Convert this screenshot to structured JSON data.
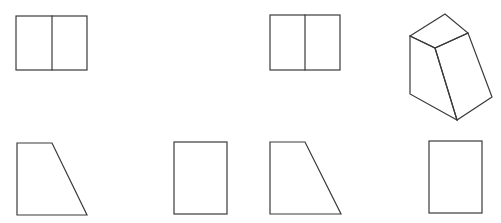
{
  "diagram": {
    "type": "orthographic-projection-views",
    "background": "#ffffff",
    "line_color": "#3a3a3a",
    "figures": [
      {
        "id": "view-a-top",
        "kind": "rectangle-split",
        "x": 16,
        "y": 16,
        "width": 71,
        "height": 54,
        "divider_x": 52
      },
      {
        "id": "view-b-top",
        "kind": "rectangle-split",
        "x": 270,
        "y": 15,
        "width": 70,
        "height": 55,
        "divider_x": 305
      },
      {
        "id": "isometric-wedge",
        "kind": "isometric-solid",
        "vertices": {
          "top_back": [
            445,
            14
          ],
          "top_left": [
            410,
            36
          ],
          "top_front": [
            435,
            48
          ],
          "top_right": [
            468,
            33
          ],
          "bottom_left": [
            410,
            94
          ],
          "bottom_front": [
            457,
            120
          ],
          "bottom_right": [
            492,
            97
          ]
        }
      },
      {
        "id": "view-a-front",
        "kind": "trapezoid",
        "points": [
          [
            17,
            143
          ],
          [
            52,
            143
          ],
          [
            87,
            215
          ],
          [
            17,
            215
          ]
        ]
      },
      {
        "id": "view-a-side",
        "kind": "rectangle",
        "x": 174,
        "y": 142,
        "width": 53,
        "height": 72
      },
      {
        "id": "view-b-front",
        "kind": "trapezoid",
        "points": [
          [
            270,
            142
          ],
          [
            305,
            142
          ],
          [
            341,
            214
          ],
          [
            270,
            214
          ]
        ]
      },
      {
        "id": "view-b-side",
        "kind": "rectangle",
        "x": 429,
        "y": 141,
        "width": 53,
        "height": 72
      }
    ]
  }
}
